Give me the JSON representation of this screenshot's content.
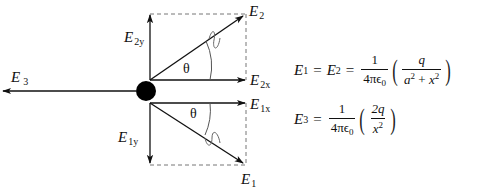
{
  "diagram": {
    "colors": {
      "line": "#111111",
      "dashed": "#777777",
      "charge": "#000000",
      "wiggle": "#666666"
    },
    "vectors": [
      {
        "id": "E2",
        "label": "E",
        "sub": "2",
        "from": [
          150,
          80
        ],
        "to": [
          243,
          16
        ]
      },
      {
        "id": "E2x",
        "label": "E",
        "sub": "2x",
        "from": [
          150,
          80
        ],
        "to": [
          245,
          80
        ]
      },
      {
        "id": "E2y",
        "label": "E",
        "sub": "2y",
        "from": [
          150,
          80
        ],
        "to": [
          150,
          15
        ]
      },
      {
        "id": "E1",
        "label": "E",
        "sub": "1",
        "from": [
          150,
          103
        ],
        "to": [
          243,
          163
        ]
      },
      {
        "id": "E1x",
        "label": "E",
        "sub": "1x",
        "from": [
          150,
          103
        ],
        "to": [
          245,
          103
        ]
      },
      {
        "id": "E1y",
        "label": "E",
        "sub": "1y",
        "from": [
          150,
          103
        ],
        "to": [
          150,
          163
        ]
      },
      {
        "id": "E3",
        "label": "E",
        "sub": "3",
        "from": [
          136,
          91
        ],
        "to": [
          3,
          91
        ]
      }
    ],
    "angle_label": "θ",
    "charge": {
      "cx": 146,
      "cy": 91,
      "r": 10
    }
  },
  "labels": {
    "E2": {
      "main": "E",
      "sub": "2"
    },
    "E2x": {
      "main": "E",
      "sub": "2x"
    },
    "E2y": {
      "main": "E",
      "sub": "2y"
    },
    "E1": {
      "main": "E",
      "sub": "1"
    },
    "E1x": {
      "main": "E",
      "sub": "1x"
    },
    "E1y": {
      "main": "E",
      "sub": "1y"
    },
    "E3": {
      "main": "E",
      "sub": "3"
    },
    "theta_upper": "θ",
    "theta_lower": "θ"
  },
  "equations": {
    "eq1": {
      "lhs1": "E",
      "lhs1_sub": "1",
      "eq_sign": "=",
      "lhs2": "E",
      "lhs2_sub": "2",
      "eq_sign2": "=",
      "coef_num": "1",
      "coef_den": "4πϵ",
      "coef_den_sub": "0",
      "paren_open": "(",
      "frac_num": "q",
      "frac_den_a": "a",
      "frac_den_a_sup": "2",
      "frac_den_plus": " + ",
      "frac_den_x": "x",
      "frac_den_x_sup": "2",
      "paren_close": ")"
    },
    "eq2": {
      "lhs": "E",
      "lhs_sub": "3",
      "eq_sign": "=",
      "coef_num": "1",
      "coef_den": "4πϵ",
      "coef_den_sub": "0",
      "paren_open": "(",
      "frac_num": "2q",
      "frac_den_x": "x",
      "frac_den_x_sup": "2",
      "paren_close": ")"
    }
  }
}
